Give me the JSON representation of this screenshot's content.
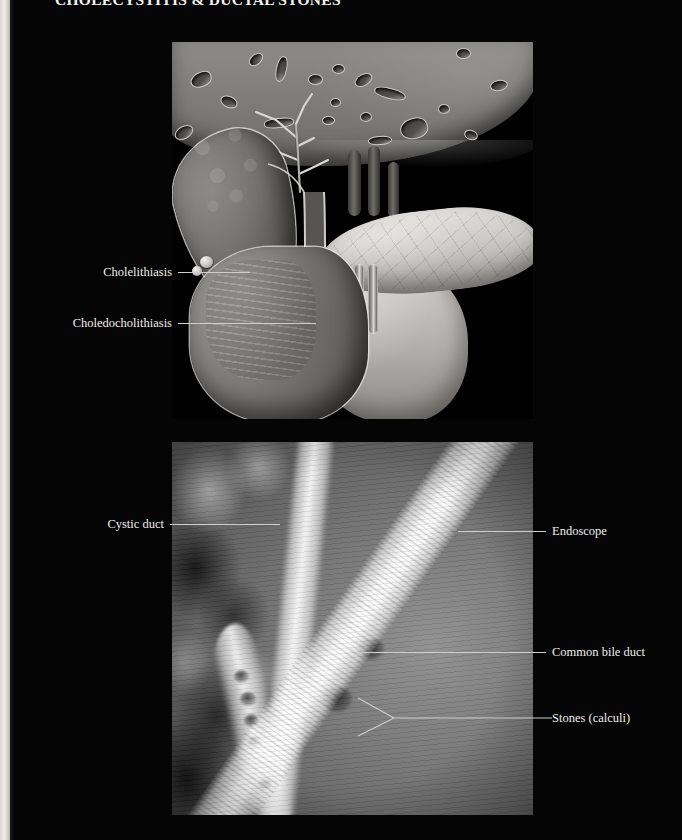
{
  "page": {
    "title": "CHOLECYSTITIS & DUCTAL STONES",
    "background_color": "#000000",
    "text_color": "#efeeea",
    "leader_line_color": "#cfcec9"
  },
  "figures": [
    {
      "id": "anatomy",
      "kind": "medical-illustration",
      "caption_labels": [
        "Cholelithiasis",
        "Choledocholithiasis"
      ],
      "depicted_structures": [
        "liver",
        "intrahepatic bile ducts",
        "gallbladder",
        "cystic duct",
        "common bile duct",
        "pancreas",
        "duodenum"
      ]
    },
    {
      "id": "xray",
      "kind": "ercp-cholangiogram",
      "caption_labels": [
        "Cystic duct",
        "Endoscope",
        "Common bile duct",
        "Stones (calculi)"
      ],
      "depicted_structures": [
        "contrast-filled biliary tree",
        "endoscope",
        "filling defects"
      ]
    }
  ],
  "labels": {
    "cholelithiasis": "Cholelithiasis",
    "choledocholithiasis": "Choledocholithiasis",
    "cystic_duct": "Cystic duct",
    "endoscope": "Endoscope",
    "common_bile_duct": "Common bile duct",
    "stones_calculi": "Stones (calculi)"
  }
}
